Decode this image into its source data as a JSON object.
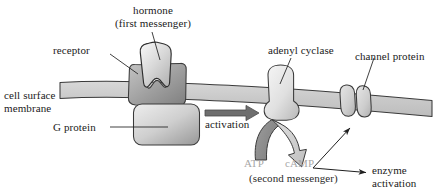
{
  "figure": {
    "background_color": "#ffffff",
    "ink_color": "#1a1a1a",
    "gray_text_color": "#a7a7a7",
    "membrane_fill": "#c9c9c9",
    "protein_light_fill": "#dcdcdc",
    "protein_dark_fill": "#a0a0a0",
    "arrow_dark_fill": "#6e6e6e"
  },
  "labels": {
    "hormone_line1": "hormone",
    "hormone_line2": "(first messenger)",
    "receptor": "receptor",
    "cell_surface_line1": "cell surface",
    "cell_surface_line2": "membrane",
    "g_protein": "G protein",
    "activation": "activation",
    "adenyl_cyclase": "adenyl cyclase",
    "channel_protein": "channel protein",
    "atp": "ATP",
    "camp": "cAMP",
    "second_messenger": "(second messenger)",
    "enzyme_line1": "enzyme",
    "enzyme_line2": "activation"
  },
  "structures": [
    {
      "name": "cell-surface-membrane",
      "role": "lipid bilayer band spanning the figure, sloping down to the right"
    },
    {
      "name": "hormone",
      "role": "first messenger ligand, irregular blob with wavy base"
    },
    {
      "name": "receptor",
      "role": "transmembrane receptor with complementary wavy binding site"
    },
    {
      "name": "g-protein",
      "role": "rounded rectangle on the inner membrane face"
    },
    {
      "name": "adenyl-cyclase",
      "role": "transmembrane enzyme converting ATP to cAMP"
    },
    {
      "name": "channel-protein",
      "role": "two subunits forming an aqueous pore"
    }
  ],
  "flow": [
    {
      "name": "activation-arrow",
      "from": "g-protein",
      "to": "adenyl-cyclase",
      "label": "activation"
    },
    {
      "name": "atp-to-camp-arrow",
      "from": "ATP",
      "to": "cAMP",
      "label": ""
    },
    {
      "name": "camp-to-channel-arrow",
      "from": "cAMP",
      "to": "channel protein",
      "label": ""
    },
    {
      "name": "camp-to-enzyme-arrow",
      "from": "cAMP",
      "to": "enzyme activation",
      "label": ""
    }
  ]
}
